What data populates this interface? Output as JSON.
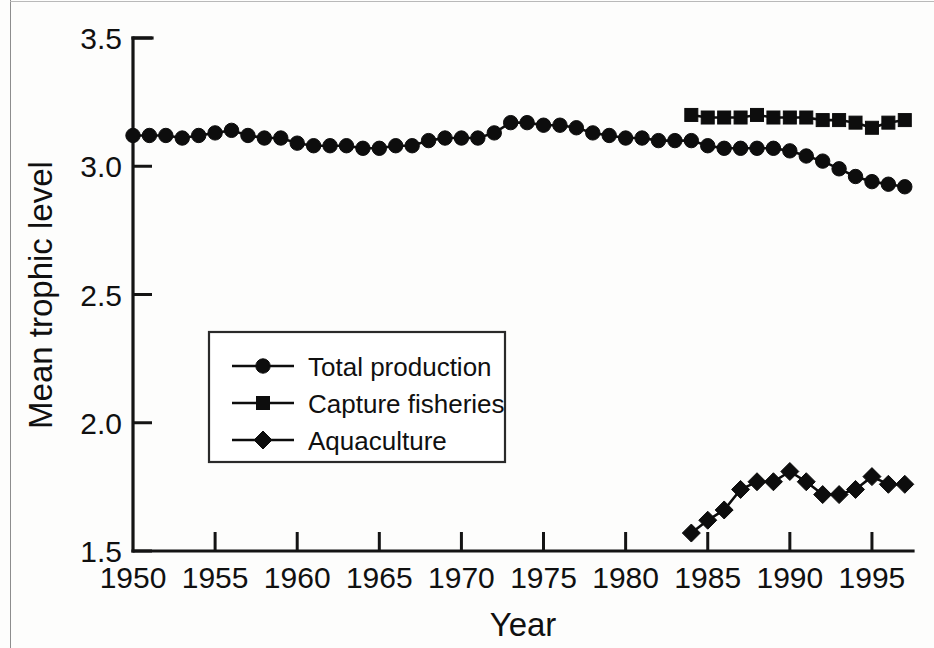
{
  "chart_data": {
    "type": "line",
    "title": "",
    "xlabel": "Year",
    "ylabel": "Mean trophic level",
    "xlim": [
      1950,
      1997.5
    ],
    "ylim": [
      1.5,
      3.5
    ],
    "xticks": [
      1950,
      1955,
      1960,
      1965,
      1970,
      1975,
      1980,
      1985,
      1990,
      1995
    ],
    "xticklabels": [
      "1950",
      "1955",
      "1960",
      "1965",
      "1970",
      "1975",
      "1980",
      "1985",
      "1990",
      "1995"
    ],
    "yticks": [
      1.5,
      2.0,
      2.5,
      3.0,
      3.5
    ],
    "yticklabels": [
      "1.5",
      "2.0",
      "2.5",
      "3.0",
      "3.5"
    ],
    "grid": false,
    "legend_position": "center-left",
    "series": [
      {
        "name": "Total production",
        "marker": "circle",
        "x": [
          1950,
          1951,
          1952,
          1953,
          1954,
          1955,
          1956,
          1957,
          1958,
          1959,
          1960,
          1961,
          1962,
          1963,
          1964,
          1965,
          1966,
          1967,
          1968,
          1969,
          1970,
          1971,
          1972,
          1973,
          1974,
          1975,
          1976,
          1977,
          1978,
          1979,
          1980,
          1981,
          1982,
          1983,
          1984,
          1985,
          1986,
          1987,
          1988,
          1989,
          1990,
          1991,
          1992,
          1993,
          1994,
          1995,
          1996,
          1997
        ],
        "values": [
          3.12,
          3.12,
          3.12,
          3.11,
          3.12,
          3.13,
          3.14,
          3.12,
          3.11,
          3.11,
          3.09,
          3.08,
          3.08,
          3.08,
          3.07,
          3.07,
          3.08,
          3.08,
          3.1,
          3.11,
          3.11,
          3.11,
          3.13,
          3.17,
          3.17,
          3.16,
          3.16,
          3.15,
          3.13,
          3.12,
          3.11,
          3.11,
          3.1,
          3.1,
          3.1,
          3.08,
          3.07,
          3.07,
          3.07,
          3.07,
          3.06,
          3.04,
          3.02,
          2.99,
          2.96,
          2.94,
          2.93,
          2.92
        ]
      },
      {
        "name": "Capture fisheries",
        "marker": "square",
        "x": [
          1984,
          1985,
          1986,
          1987,
          1988,
          1989,
          1990,
          1991,
          1992,
          1993,
          1994,
          1995,
          1996,
          1997
        ],
        "values": [
          3.2,
          3.19,
          3.19,
          3.19,
          3.2,
          3.19,
          3.19,
          3.19,
          3.18,
          3.18,
          3.17,
          3.15,
          3.17,
          3.18
        ]
      },
      {
        "name": "Aquaculture",
        "marker": "diamond",
        "x": [
          1984,
          1985,
          1986,
          1987,
          1988,
          1989,
          1990,
          1991,
          1992,
          1993,
          1994,
          1995,
          1996,
          1997
        ],
        "values": [
          1.57,
          1.62,
          1.66,
          1.74,
          1.77,
          1.77,
          1.81,
          1.77,
          1.72,
          1.72,
          1.74,
          1.79,
          1.76,
          1.76
        ]
      }
    ]
  },
  "legend": {
    "entries": [
      {
        "label": "Total production",
        "marker": "circle"
      },
      {
        "label": "Capture fisheries",
        "marker": "square"
      },
      {
        "label": "Aquaculture",
        "marker": "diamond"
      }
    ]
  },
  "axes": {
    "y_axis_label": "Mean trophic level",
    "x_axis_label": "Year"
  }
}
